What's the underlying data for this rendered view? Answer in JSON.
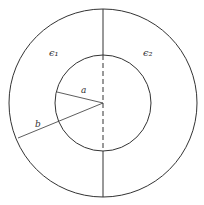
{
  "diagram": {
    "labels": {
      "eps1": "ϵ₁",
      "eps2": "ϵ₂",
      "a": "a",
      "b": "b"
    },
    "colors": {
      "stroke": "#333333",
      "background": "#ffffff"
    }
  }
}
